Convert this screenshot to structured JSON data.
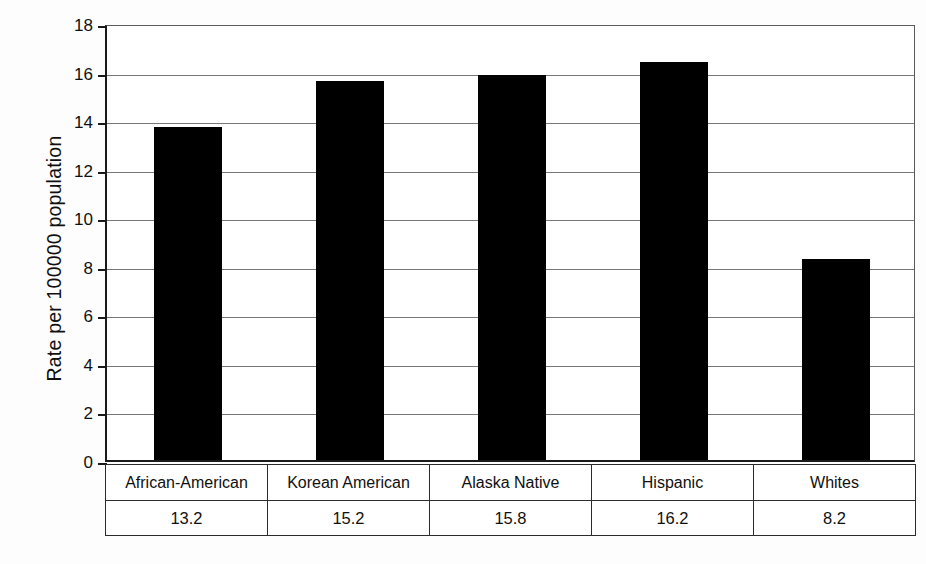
{
  "chart_data": {
    "type": "bar",
    "title": "",
    "xlabel": "",
    "ylabel": "Rate per 100000 population",
    "categories": [
      "African-American",
      "Korean American",
      "Alaska Native",
      "Hispanic",
      "Whites"
    ],
    "values": [
      13.2,
      15.2,
      15.8,
      16.2,
      8.2
    ],
    "bar_heights_drawn": [
      13.7,
      15.6,
      15.85,
      16.4,
      8.3
    ],
    "value_labels": [
      "13.2",
      "15.2",
      "15.8",
      "16.2",
      "8.2"
    ],
    "ylim": [
      0,
      18
    ],
    "ytick_values": [
      0,
      2,
      4,
      6,
      8,
      10,
      12,
      14,
      16,
      18
    ],
    "ytick_labels": [
      "0",
      "2",
      "4",
      "6",
      "8",
      "10",
      "12",
      "14",
      "16",
      "18"
    ],
    "grid": true,
    "legend": "none",
    "bar_color": "#000000",
    "grid_color": "#777777",
    "axis_color": "#1a1a1a",
    "background_color": "#ffffff",
    "data_table_below_axis": true
  },
  "axis": {
    "y_title": "Rate per 100000 population"
  },
  "table": {
    "category_row": [
      "African-American",
      "Korean American",
      "Alaska Native",
      "Hispanic",
      "Whites"
    ],
    "value_row": [
      "13.2",
      "15.2",
      "15.8",
      "16.2",
      "8.2"
    ]
  }
}
